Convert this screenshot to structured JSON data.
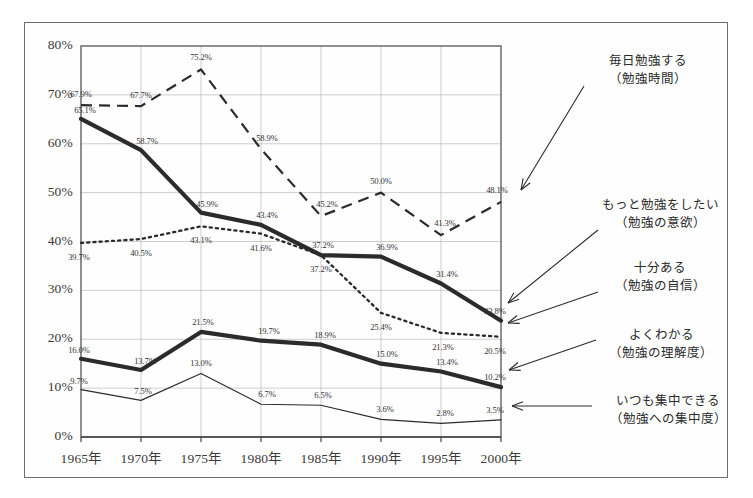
{
  "figure": {
    "frame": {
      "x": 24,
      "y": 22,
      "width": 704,
      "height": 456
    }
  },
  "chart_data": {
    "type": "line",
    "title": "",
    "subtitle": "",
    "xlabel": "",
    "ylabel": "",
    "grid": true,
    "legend_position": "right-callouts",
    "x": [
      "1965年",
      "1970年",
      "1975年",
      "1980年",
      "1985年",
      "1990年",
      "1995年",
      "2000年"
    ],
    "categories": [
      "1965年",
      "1970年",
      "1975年",
      "1980年",
      "1985年",
      "1990年",
      "1995年",
      "2000年"
    ],
    "ylim": [
      0,
      80
    ],
    "ytick_labels": [
      "0%",
      "10%",
      "20%",
      "30%",
      "40%",
      "50%",
      "60%",
      "70%",
      "80%"
    ],
    "ytick_values": [
      0,
      10,
      20,
      30,
      40,
      50,
      60,
      70,
      80
    ],
    "series": [
      {
        "name": "毎日勉強する",
        "sub": "（勉強時間）",
        "style": "dashed",
        "values": [
          67.9,
          67.7,
          75.2,
          58.9,
          45.2,
          50.0,
          41.3,
          48.1
        ],
        "labels": [
          "67.9%",
          "67.7%",
          "75.2%",
          "58.9%",
          "45.2%",
          "50.0%",
          "41.3%",
          "48.1%"
        ]
      },
      {
        "name": "もっと勉強をしたい",
        "sub": "（勉強の意欲）",
        "style": "thick-solid",
        "values": [
          65.1,
          58.7,
          45.9,
          43.4,
          37.2,
          36.9,
          31.4,
          23.8
        ],
        "labels": [
          "65.1%",
          "58.7%",
          "45.9%",
          "43.4%",
          "37.2%",
          "36.9%",
          "31.4%",
          "23.8%"
        ]
      },
      {
        "name": "十分ある",
        "sub": "（勉強の自信）",
        "style": "dotted",
        "values": [
          39.7,
          40.5,
          43.1,
          41.6,
          37.2,
          25.4,
          21.3,
          20.5
        ],
        "labels": [
          "39.7%",
          "40.5%",
          "43.1%",
          "41.6%",
          "37.2%",
          "25.4%",
          "21.3%",
          "20.5%"
        ]
      },
      {
        "name": "よくわかる",
        "sub": "（勉強の理解度）",
        "style": "thick-solid",
        "values": [
          16.0,
          13.7,
          21.5,
          19.7,
          18.9,
          15.0,
          13.4,
          10.2
        ],
        "labels": [
          "16.0%",
          "13.7%",
          "21.5%",
          "19.7%",
          "18.9%",
          "15.0%",
          "13.4%",
          "10.2%"
        ]
      },
      {
        "name": "いつも集中できる",
        "sub": "（勉強への集中度）",
        "style": "thin-solid",
        "values": [
          9.7,
          7.5,
          13.0,
          6.7,
          6.5,
          3.6,
          2.8,
          3.5
        ],
        "labels": [
          "9.7%",
          "7.5%",
          "13.0%",
          "6.7%",
          "6.5%",
          "3.6%",
          "2.8%",
          "3.5%"
        ]
      }
    ],
    "annotations": [
      {
        "name": "毎日勉強する",
        "sub": "（勉強時間）"
      },
      {
        "name": "もっと勉強をしたい",
        "sub": "（勉強の意欲）"
      },
      {
        "name": "十分ある",
        "sub": "（勉強の自信）"
      },
      {
        "name": "よくわかる",
        "sub": "（勉強の理解度）"
      },
      {
        "name": "いつも集中できる",
        "sub": "（勉強への集中度）"
      }
    ],
    "colors": {
      "ink": "#2b2b2b",
      "grid": "#b9b9b9",
      "axis": "#555555",
      "frame": "#6e6e6e",
      "background": "#ffffff"
    }
  }
}
